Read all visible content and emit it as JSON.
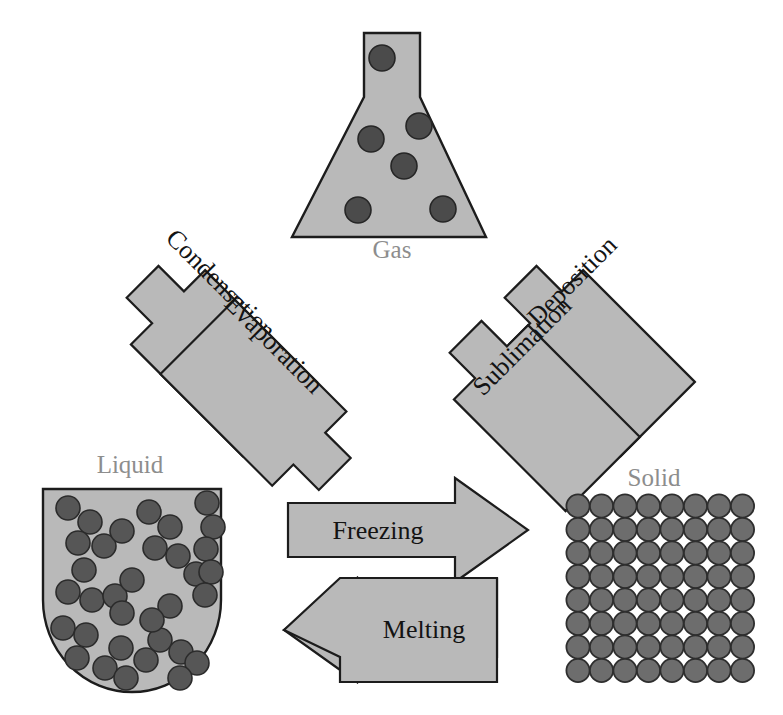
{
  "figure": {
    "title_text": "",
    "background_color": "#ffffff",
    "arrow_fill": "#b9b9b9",
    "arrow_stroke": "#1c1c1c",
    "vessel_fill": "#b9b9b9",
    "label_color_state": "#8d8d8d",
    "label_color_arrow": "#131313",
    "particle_color_gas": "#4b4b4b",
    "particle_color_liquid": "#565656",
    "particle_color_solid": "#6d6d6d"
  },
  "states": {
    "gas": {
      "label": "Gas",
      "label_x": 392,
      "label_y": 258,
      "vessel_shape": "erlenmeyer-flask",
      "particle_count": 6,
      "particles": [
        {
          "cx": 382,
          "cy": 58,
          "r": 13
        },
        {
          "cx": 419,
          "cy": 126,
          "r": 13
        },
        {
          "cx": 371,
          "cy": 139,
          "r": 13
        },
        {
          "cx": 404,
          "cy": 166,
          "r": 13
        },
        {
          "cx": 358,
          "cy": 210,
          "r": 13
        },
        {
          "cx": 443,
          "cy": 209,
          "r": 13
        }
      ]
    },
    "liquid": {
      "label": "Liquid",
      "label_x": 130,
      "label_y": 473,
      "vessel_shape": "round-bottom-beaker",
      "particle_count": 34,
      "particles": [
        {
          "cx": 68,
          "cy": 508,
          "r": 12
        },
        {
          "cx": 90,
          "cy": 522,
          "r": 12
        },
        {
          "cx": 78,
          "cy": 543,
          "r": 12
        },
        {
          "cx": 104,
          "cy": 546,
          "r": 12
        },
        {
          "cx": 122,
          "cy": 531,
          "r": 12
        },
        {
          "cx": 84,
          "cy": 570,
          "r": 12
        },
        {
          "cx": 68,
          "cy": 592,
          "r": 12
        },
        {
          "cx": 92,
          "cy": 600,
          "r": 12
        },
        {
          "cx": 115,
          "cy": 596,
          "r": 12
        },
        {
          "cx": 132,
          "cy": 580,
          "r": 12
        },
        {
          "cx": 122,
          "cy": 613,
          "r": 12
        },
        {
          "cx": 63,
          "cy": 628,
          "r": 12
        },
        {
          "cx": 86,
          "cy": 635,
          "r": 12
        },
        {
          "cx": 77,
          "cy": 658,
          "r": 12
        },
        {
          "cx": 105,
          "cy": 668,
          "r": 12
        },
        {
          "cx": 126,
          "cy": 678,
          "r": 12
        },
        {
          "cx": 146,
          "cy": 660,
          "r": 12
        },
        {
          "cx": 121,
          "cy": 648,
          "r": 12
        },
        {
          "cx": 149,
          "cy": 512,
          "r": 12
        },
        {
          "cx": 170,
          "cy": 527,
          "r": 12
        },
        {
          "cx": 155,
          "cy": 548,
          "r": 12
        },
        {
          "cx": 178,
          "cy": 556,
          "r": 12
        },
        {
          "cx": 196,
          "cy": 574,
          "r": 12
        },
        {
          "cx": 160,
          "cy": 640,
          "r": 12
        },
        {
          "cx": 181,
          "cy": 652,
          "r": 12
        },
        {
          "cx": 170,
          "cy": 606,
          "r": 12
        },
        {
          "cx": 152,
          "cy": 620,
          "r": 12
        },
        {
          "cx": 207,
          "cy": 503,
          "r": 12
        },
        {
          "cx": 213,
          "cy": 527,
          "r": 12
        },
        {
          "cx": 206,
          "cy": 549,
          "r": 12
        },
        {
          "cx": 211,
          "cy": 572,
          "r": 12
        },
        {
          "cx": 205,
          "cy": 595,
          "r": 12
        },
        {
          "cx": 197,
          "cy": 663,
          "r": 12
        },
        {
          "cx": 180,
          "cy": 678,
          "r": 12
        }
      ]
    },
    "solid": {
      "label": "Solid",
      "label_x": 654,
      "label_y": 486,
      "vessel_shape": "lattice-grid",
      "grid_columns": 8,
      "grid_rows": 8,
      "grid_origin_x": 578,
      "grid_origin_y": 506,
      "grid_step_x": 23.5,
      "grid_step_y": 23.5,
      "particle_radius": 11.6
    }
  },
  "transitions": [
    {
      "id": "condensation",
      "label": "Condensation",
      "from": "gas",
      "to": "liquid",
      "direction": "down-left",
      "rotation_deg": 45,
      "label_x": 215,
      "label_y": 290
    },
    {
      "id": "evaporation",
      "label": "Evaporation",
      "from": "liquid",
      "to": "gas",
      "direction": "up-right",
      "rotation_deg": 45,
      "label_x": 265,
      "label_y": 356
    },
    {
      "id": "deposition",
      "label": "Deposition",
      "from": "gas",
      "to": "solid",
      "direction": "down-right",
      "rotation_deg": -45,
      "label_x": 578,
      "label_y": 287
    },
    {
      "id": "sublimation",
      "label": "Sublimation",
      "from": "solid",
      "to": "gas",
      "direction": "up-left",
      "rotation_deg": -45,
      "label_x": 532,
      "label_y": 353
    },
    {
      "id": "freezing",
      "label": "Freezing",
      "from": "liquid",
      "to": "solid",
      "direction": "right",
      "rotation_deg": 0,
      "label_x": 378,
      "label_y": 530
    },
    {
      "id": "melting",
      "label": "Melting",
      "from": "solid",
      "to": "liquid",
      "direction": "left",
      "rotation_deg": 0,
      "label_x": 420,
      "label_y": 604
    }
  ],
  "artifacts": {
    "corner_mark": "page-edge-mark"
  }
}
